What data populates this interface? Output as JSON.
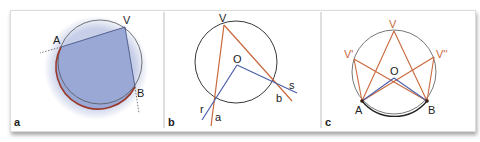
{
  "figure": {
    "panels": [
      {
        "id": "a",
        "label": "a",
        "points": {
          "A": "A",
          "V": "V",
          "B": "B"
        },
        "description": "Inscribed angle AVB with shaded region and highlighted arc AB"
      },
      {
        "id": "b",
        "label": "b",
        "points": {
          "V": "V",
          "O": "O",
          "a": "a",
          "b": "b",
          "r": "r",
          "s": "s"
        },
        "description": "Inscribed angle at V and central angle at O subtending the same arc"
      },
      {
        "id": "c",
        "label": "c",
        "points": {
          "V": "V",
          "V1": "V'",
          "V2": "V''",
          "O": "O",
          "A": "A",
          "B": "B"
        },
        "description": "Multiple inscribed angles V, V', V'' subtending the same arc AB with central angle at O"
      }
    ],
    "colors": {
      "circle": "#444444",
      "arc_highlight": "#9a3a2a",
      "shade_fill": "#9aa8d6",
      "orange_lines": "#c8683c",
      "blue_lines": "#4a5fa8",
      "arc_c": "#222222"
    }
  }
}
